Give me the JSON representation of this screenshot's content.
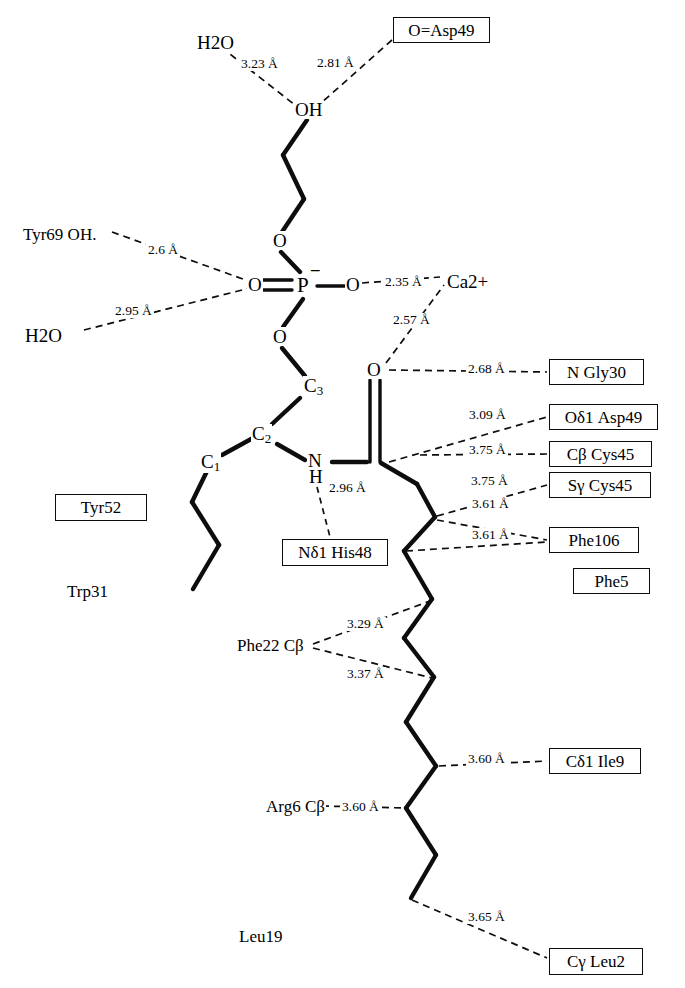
{
  "diagram": {
    "type": "chemical-interaction-diagram",
    "ink_color": "#0d0d0d",
    "background_color": "#ffffff"
  },
  "atoms": {
    "oh_head": "OH",
    "o_ester_upper": "O",
    "p_center": "P",
    "p_charge": "–",
    "o_double_left": "O",
    "o_bridge_right": "O",
    "o_ester_lower": "O",
    "c3": "C",
    "c3_sub": "3",
    "c2": "C",
    "c2_sub": "2",
    "c1": "C",
    "c1_sub": "1",
    "n_amide": "N",
    "h_amide": "H",
    "o_carbonyl": "O"
  },
  "free_labels": [
    {
      "name": "water-top",
      "text": "H",
      "sub": "2",
      "text2": "O",
      "x": 196,
      "y": 33
    },
    {
      "name": "tyr69-oh",
      "text": "Tyr69 OH.",
      "x": 22,
      "y": 226
    },
    {
      "name": "water-left",
      "text": "H",
      "sub": "2",
      "text2": "O",
      "x": 24,
      "y": 326
    },
    {
      "name": "calcium-ion",
      "text": "Ca",
      "sup": "2+",
      "x": 446,
      "y": 272
    },
    {
      "name": "trp31",
      "text": "Trp31",
      "x": 66,
      "y": 583
    },
    {
      "name": "phe22-cb",
      "text": "Phe22 Cβ",
      "x": 236,
      "y": 637
    },
    {
      "name": "arg6-cb",
      "text": "Arg6 Cβ",
      "x": 265,
      "y": 798
    },
    {
      "name": "leu19",
      "text": "Leu19",
      "x": 238,
      "y": 928
    }
  ],
  "boxed_labels": [
    {
      "name": "o-asp49",
      "text": "O=Asp49",
      "x": 393,
      "y": 17,
      "w": 97,
      "h": 26
    },
    {
      "name": "n-gly30",
      "text": "N  Gly30",
      "x": 549,
      "y": 359,
      "w": 95,
      "h": 26
    },
    {
      "name": "od1-asp49",
      "text": "Oδ1 Asp49",
      "x": 549,
      "y": 404,
      "w": 109,
      "h": 26
    },
    {
      "name": "cb-cys45",
      "text": "Cβ  Cys45",
      "x": 549,
      "y": 441,
      "w": 103,
      "h": 26
    },
    {
      "name": "sg-cys45",
      "text": "Sγ  Cys45",
      "x": 549,
      "y": 472,
      "w": 102,
      "h": 26
    },
    {
      "name": "phe106",
      "text": "Phe106",
      "x": 549,
      "y": 527,
      "w": 90,
      "h": 26
    },
    {
      "name": "phe5",
      "text": "Phe5",
      "x": 573,
      "y": 568,
      "w": 77,
      "h": 26
    },
    {
      "name": "tyr52",
      "text": "Tyr52",
      "x": 55,
      "y": 494,
      "w": 92,
      "h": 27
    },
    {
      "name": "nd1-his48",
      "text": "Nδ1 His48",
      "x": 282,
      "y": 539,
      "w": 106,
      "h": 27
    },
    {
      "name": "cd1-ile9",
      "text": "Cδ1 Ile9",
      "x": 549,
      "y": 748,
      "w": 92,
      "h": 26
    },
    {
      "name": "cy-leu2",
      "text": "Cγ Leu2",
      "x": 549,
      "y": 948,
      "w": 94,
      "h": 27
    }
  ],
  "distances": [
    {
      "name": "dist-water-oh",
      "text": "3.23 Å",
      "x": 239,
      "y": 57
    },
    {
      "name": "dist-asp49-oh",
      "text": "2.81 Å",
      "x": 315,
      "y": 56
    },
    {
      "name": "dist-tyr69-o",
      "text": "2.6 Å",
      "x": 146,
      "y": 243
    },
    {
      "name": "dist-water-o",
      "text": "2.95 Å",
      "x": 113,
      "y": 304
    },
    {
      "name": "dist-p-o-ca",
      "text": "2.35 Å",
      "x": 383,
      "y": 275
    },
    {
      "name": "dist-carbonyl-ca",
      "text": "2.57 Å",
      "x": 391,
      "y": 313
    },
    {
      "name": "dist-gly30",
      "text": "2.68 Å",
      "x": 466,
      "y": 362
    },
    {
      "name": "dist-asp49-od1",
      "text": "3.09 Å",
      "x": 467,
      "y": 408
    },
    {
      "name": "dist-cys45-cb",
      "text": "3.75 Å",
      "x": 467,
      "y": 443
    },
    {
      "name": "dist-cys45-sg",
      "text": "3.75 Å",
      "x": 469,
      "y": 474
    },
    {
      "name": "dist-phe106-a",
      "text": "3.61 Å",
      "x": 470,
      "y": 497
    },
    {
      "name": "dist-phe106-b",
      "text": "3.61 Å",
      "x": 470,
      "y": 528
    },
    {
      "name": "dist-his48",
      "text": "2.96 Å",
      "x": 327,
      "y": 481
    },
    {
      "name": "dist-phe22-a",
      "text": "3.29 Å",
      "x": 345,
      "y": 617
    },
    {
      "name": "dist-phe22-b",
      "text": "3.37 Å",
      "x": 345,
      "y": 667
    },
    {
      "name": "dist-ile9",
      "text": "3.60 Å",
      "x": 466,
      "y": 752
    },
    {
      "name": "dist-arg6",
      "text": "3.60 Å",
      "x": 340,
      "y": 800
    },
    {
      "name": "dist-leu2",
      "text": "3.65 Å",
      "x": 466,
      "y": 910
    }
  ],
  "chain_notes": {
    "headgroup": "ethanolamine headgroup with terminal OH",
    "phosphate": "phosphate with P, one double-bonded O, one negative charge, two ester O",
    "sn1_chain": "alkyl chain from C1",
    "sn2_chain": "amide-linked acyl chain descending to Cγ Leu2"
  }
}
